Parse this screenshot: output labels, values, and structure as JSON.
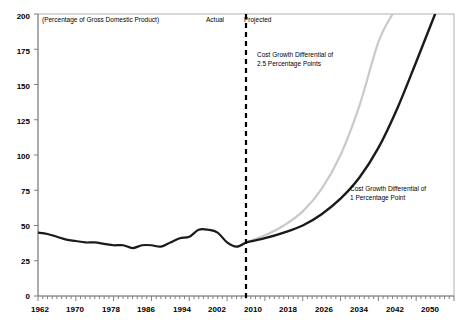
{
  "chart_data": {
    "type": "line",
    "title": "",
    "subtitle": "(Percentage of Gross Domestic Product)",
    "xlabel": "",
    "ylabel": "",
    "xlim": [
      1962,
      2050
    ],
    "ylim": [
      0,
      200
    ],
    "grid": false,
    "legend_position": "inline-annotations",
    "xticks": [
      "1962",
      "1970",
      "1978",
      "1986",
      "1994",
      "2002",
      "2010",
      "2018",
      "2026",
      "2034",
      "2042",
      "2050"
    ],
    "xtick_values": [
      1962,
      1970,
      1978,
      1986,
      1994,
      2002,
      2010,
      2018,
      2026,
      2034,
      2042,
      2050
    ],
    "yticks": [
      "0",
      "25",
      "50",
      "75",
      "100",
      "125",
      "150",
      "175",
      "200"
    ],
    "ytick_values": [
      0,
      25,
      50,
      75,
      100,
      125,
      150,
      175,
      200
    ],
    "minor_tick_interval_x": 1,
    "divider": {
      "x_value": 2006,
      "style": "dashed-vertical",
      "left_label": "Actual",
      "right_label": "Projected"
    },
    "series": [
      {
        "name": "Actual",
        "color": "#1a1a1a",
        "width": 2.2,
        "x": [
          1962,
          1964,
          1966,
          1968,
          1970,
          1972,
          1974,
          1976,
          1978,
          1980,
          1982,
          1984,
          1986,
          1988,
          1990,
          1992,
          1994,
          1996,
          1998,
          2000,
          2002,
          2004,
          2006
        ],
        "values": [
          45,
          44,
          42,
          40,
          39,
          38,
          38,
          37,
          36,
          36,
          34,
          36,
          36,
          35,
          38,
          41,
          42,
          47,
          47,
          45,
          38,
          35,
          38
        ]
      },
      {
        "name": "Cost Growth Differential of 2.5 Percentage Points",
        "color": "#c9c9c9",
        "width": 2.2,
        "x": [
          2006,
          2010,
          2014,
          2018,
          2022,
          2026,
          2030,
          2034,
          2037
        ],
        "values": [
          38,
          43,
          50,
          60,
          76,
          100,
          135,
          180,
          200
        ]
      },
      {
        "name": "Cost Growth Differential of 1 Percentage Point",
        "color": "#1a1a1a",
        "width": 2.4,
        "x": [
          2006,
          2010,
          2014,
          2018,
          2022,
          2026,
          2030,
          2034,
          2038,
          2042,
          2046
        ],
        "values": [
          38,
          41,
          45,
          50,
          58,
          69,
          84,
          105,
          133,
          166,
          200
        ]
      }
    ],
    "annotations": [
      {
        "name": "annotation-high-growth",
        "line1": "Cost Growth Differential of",
        "line2": "2.5 Percentage Points",
        "x_px": 257,
        "y_px": 53
      },
      {
        "name": "annotation-low-growth",
        "line1": "Cost Growth Differential of",
        "line2": "1 Percentage Point",
        "x_px": 350,
        "y_px": 187
      }
    ]
  },
  "colors": {
    "axis": "#808080",
    "plot_border": "#b0b0b0",
    "actual_line": "#1a1a1a",
    "high_growth_line": "#c9c9c9",
    "low_growth_line": "#1a1a1a",
    "divider": "#000000",
    "text": "#000000"
  }
}
